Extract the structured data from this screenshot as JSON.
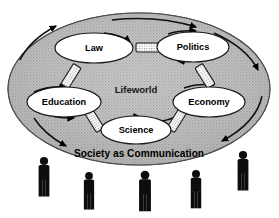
{
  "diagram": {
    "title": "Society as Communication",
    "inner_region_label": "Lifeworld",
    "outer_region_label": "Society as Communication",
    "colors": {
      "background": "#ffffff",
      "outer_ellipse_fill": "#b8b8b8",
      "outer_ellipse_stroke": "#4a4a4a",
      "node_fill": "#ffffff",
      "node_stroke": "#1a1a1a",
      "connector_fill": "#ffffff",
      "connector_stroke": "#1a1a1a",
      "arrow_color": "#000000",
      "figure_color": "#0d0d0d"
    },
    "nodes": [
      {
        "id": "law",
        "label": "Law",
        "cx": 94,
        "cy": 48,
        "rx": 39,
        "ry": 15
      },
      {
        "id": "politics",
        "label": "Politics",
        "cx": 193,
        "cy": 47,
        "rx": 36,
        "ry": 15
      },
      {
        "id": "education",
        "label": "Education",
        "cx": 64,
        "cy": 102,
        "rx": 37,
        "ry": 15
      },
      {
        "id": "economy",
        "label": "Economy",
        "cx": 209,
        "cy": 102,
        "rx": 36,
        "ry": 15
      },
      {
        "id": "science",
        "label": "Science",
        "cx": 136,
        "cy": 130,
        "rx": 35,
        "ry": 14
      }
    ],
    "connectors": [
      {
        "id": "law-politics",
        "from": "law",
        "to": "politics",
        "orientation": "horizontal"
      },
      {
        "id": "law-education",
        "from": "law",
        "to": "education",
        "orientation": "diagonal-down-left"
      },
      {
        "id": "politics-economy",
        "from": "politics",
        "to": "economy",
        "orientation": "diagonal-down-right"
      },
      {
        "id": "education-science",
        "from": "education",
        "to": "science",
        "orientation": "diagonal-down-right"
      },
      {
        "id": "economy-science",
        "from": "economy",
        "to": "science",
        "orientation": "diagonal-down-left"
      }
    ],
    "figures": [
      {
        "id": "person-1",
        "x": 44,
        "y": 157,
        "scale": 1.0
      },
      {
        "id": "person-2",
        "x": 89,
        "y": 172,
        "scale": 0.95
      },
      {
        "id": "person-3",
        "x": 145,
        "y": 171,
        "scale": 1.02
      },
      {
        "id": "person-4",
        "x": 196,
        "y": 170,
        "scale": 0.97
      },
      {
        "id": "person-5",
        "x": 243,
        "y": 151,
        "scale": 1.0
      }
    ],
    "arrow_count_inner": 8,
    "arrow_count_outer": 5
  }
}
